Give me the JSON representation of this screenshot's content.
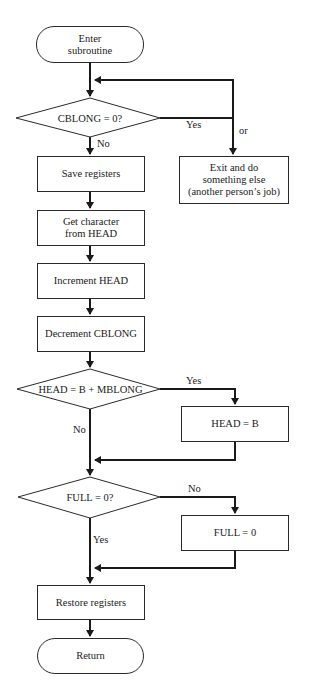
{
  "flowchart": {
    "start": "Enter\nsubroutine",
    "decision_cblong": "CBLONG = 0?",
    "save_registers": "Save registers",
    "get_character": "Get character\nfrom HEAD",
    "increment_head": "Increment HEAD",
    "decrement_cblong": "Decrement CBLONG",
    "decision_head": "HEAD = B + MBLONG",
    "head_eq_b": "HEAD = B",
    "decision_full": "FULL = 0?",
    "full_eq_0": "FULL = 0",
    "restore_registers": "Restore registers",
    "end": "Return",
    "exit_box": "Exit and do\nsomething else\n(another person’s job)"
  },
  "edge_labels": {
    "cblong_yes": "Yes",
    "cblong_no": "No",
    "or": "or",
    "head_yes": "Yes",
    "head_no": "No",
    "full_no": "No",
    "full_yes": "Yes"
  },
  "colors": {
    "line": "#1a1a1a",
    "background": "#ffffff"
  }
}
